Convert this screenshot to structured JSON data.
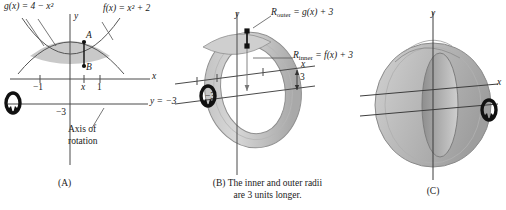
{
  "figure": {
    "panels": [
      {
        "id": "A",
        "caption": "(A)",
        "labels": {
          "g_curve": "g(x) = 4 − x²",
          "f_curve": "f(x) = x² + 2",
          "point_a": "A",
          "point_b": "B",
          "x_axis": "x",
          "y_axis": "y",
          "tick_neg1": "−1",
          "tick_x": "x",
          "tick_1": "1",
          "tick_neg3": "−3",
          "line_y": "y = −3",
          "axis_of_rotation_line1": "Axis of",
          "axis_of_rotation_line2": "rotation"
        }
      },
      {
        "id": "B",
        "caption_line1": "(B) The inner and outer radii",
        "caption_line2": "are 3 units longer.",
        "labels": {
          "r_outer": "R",
          "r_outer_sub": "outer",
          "r_outer_eq": " = g(x) + 3",
          "r_inner": "R",
          "r_inner_sub": "inner",
          "r_inner_eq": " = f(x) + 3",
          "x_axis": "x",
          "y_axis": "y",
          "tick_neg3": "−3",
          "dim_three": "3"
        }
      },
      {
        "id": "C",
        "caption": "(C)",
        "labels": {
          "x_axis": "x",
          "y_axis": "y"
        }
      }
    ]
  },
  "colors": {
    "ink": "#1a1a1a",
    "axis": "#4a4a4a",
    "curve": "#555555",
    "region_fill": "#c9c9c9",
    "solid_light": "#c5c5c5",
    "solid_mid": "#a8a8a8",
    "solid_dark": "#8c8c8c"
  }
}
